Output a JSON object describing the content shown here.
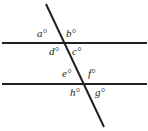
{
  "figure": {
    "type": "geometry-diagram",
    "background_color": "#ffffff",
    "line_color": "#231f20",
    "line_width_px": 2,
    "canvas": {
      "width": 148,
      "height": 131
    },
    "lines": [
      {
        "name": "upper-parallel-line",
        "orientation": "horizontal",
        "x1": 2,
        "y1": 43,
        "x2": 147,
        "y2": 43
      },
      {
        "name": "lower-parallel-line",
        "orientation": "horizontal",
        "x1": 2,
        "y1": 84,
        "x2": 147,
        "y2": 84
      },
      {
        "name": "transversal-line",
        "orientation": "diagonal",
        "x1": 46,
        "y1": 4,
        "x2": 104,
        "y2": 127
      }
    ],
    "intersections": [
      {
        "name": "upper-intersection",
        "x": 64,
        "y": 43
      },
      {
        "name": "lower-intersection",
        "x": 83,
        "y": 84
      }
    ],
    "angle_labels": [
      {
        "id": "a",
        "text": "a°",
        "position": "upper-intersection-upper-left"
      },
      {
        "id": "b",
        "text": "b°",
        "position": "upper-intersection-upper-right"
      },
      {
        "id": "d",
        "text": "d°",
        "position": "upper-intersection-lower-left"
      },
      {
        "id": "c",
        "text": "c°",
        "position": "upper-intersection-lower-right"
      },
      {
        "id": "e",
        "text": "e°",
        "position": "lower-intersection-upper-left"
      },
      {
        "id": "f",
        "text": "f°",
        "position": "lower-intersection-upper-right"
      },
      {
        "id": "h",
        "text": "h°",
        "position": "lower-intersection-lower-left"
      },
      {
        "id": "g",
        "text": "g°",
        "position": "lower-intersection-lower-right"
      }
    ]
  }
}
